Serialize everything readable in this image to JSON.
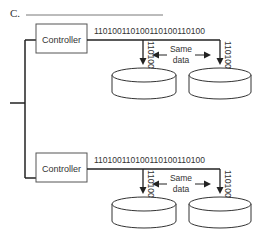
{
  "question": {
    "label": "C.",
    "answer_line": ""
  },
  "groups": [
    {
      "controller_label": "Controller",
      "bitstream": "1101001101001101001101 00",
      "bitstream_text": "110100110100110100110100",
      "disk_bits": [
        "110100",
        "110100"
      ],
      "same_data_label_line1": "Same",
      "same_data_label_line2": "data"
    },
    {
      "controller_label": "Controller",
      "bitstream_text": "110100110100110100110100",
      "disk_bits": [
        "110100",
        "110100"
      ],
      "same_data_label_line1": "Same",
      "same_data_label_line2": "data"
    }
  ],
  "colors": {
    "line": "#222222",
    "box_border": "#444444",
    "text": "#333333"
  }
}
